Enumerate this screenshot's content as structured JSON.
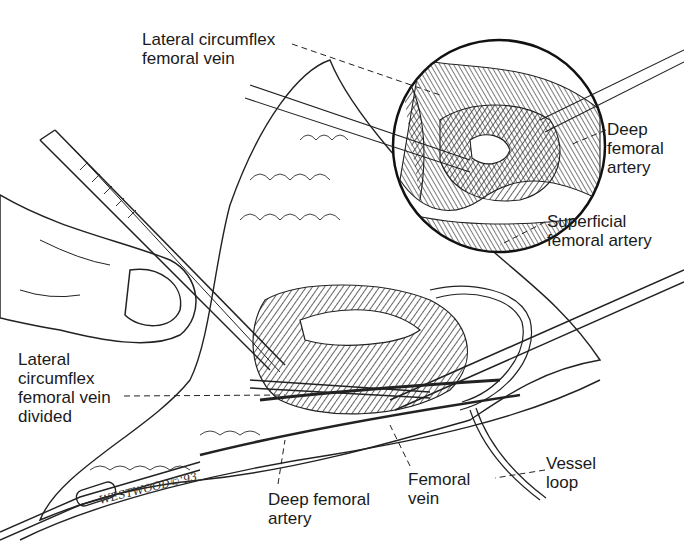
{
  "figure": {
    "type": "surgical anatomical illustration",
    "labels": [
      {
        "id": "lcfv",
        "text": "Lateral circumflex\nfemoral vein",
        "x": 142,
        "y": 30
      },
      {
        "id": "dfa_inset",
        "text": "Deep\nfemoral\nartery",
        "x": 607,
        "y": 118
      },
      {
        "id": "sfa",
        "text": "Superficial\nfemoral artery",
        "x": 547,
        "y": 210
      },
      {
        "id": "lcfv_div",
        "text": "Lateral\ncircumflex\nfemoral vein\ndivided",
        "x": 18,
        "y": 348
      },
      {
        "id": "fv",
        "text": "Femoral\nvein",
        "x": 408,
        "y": 466
      },
      {
        "id": "vessel_loop",
        "text": "Vessel\nloop",
        "x": 546,
        "y": 452
      },
      {
        "id": "dfa",
        "text": "Deep femoral\nartery",
        "x": 268,
        "y": 486
      }
    ],
    "signature": "WESTWOOD©'93",
    "colors": {
      "ink": "#1a1a1a",
      "background": "#ffffff"
    }
  }
}
